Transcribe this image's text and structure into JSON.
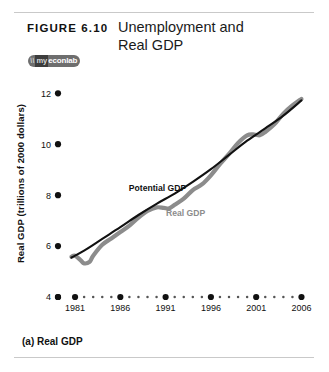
{
  "figure": {
    "number_label": "FIGURE  6.10",
    "title_line1": "Unemployment and",
    "title_line2": "Real GDP",
    "caption": "(a) Real GDP",
    "logo": {
      "mark": "\\\\",
      "my": "my",
      "econlab": "econlab"
    }
  },
  "chart_data": {
    "type": "line",
    "title": "Unemployment and Real GDP",
    "xlabel": "Year",
    "ylabel": "Real GDP (trillions of 2000 dollars)",
    "xlim": [
      1980,
      2006.5
    ],
    "ylim": [
      4,
      12.6
    ],
    "grid": false,
    "legend_position": "inline-annotation",
    "x_major_ticks": [
      "1981",
      "1986",
      "1991",
      "1996",
      "2001",
      "2006"
    ],
    "x_major_values": [
      1981,
      1986,
      1991,
      1996,
      2001,
      2006
    ],
    "x_minor_per_interval": 4,
    "y_ticks": [
      "4",
      "6",
      "8",
      "10",
      "12"
    ],
    "y_tick_values": [
      4,
      6,
      8,
      10,
      12
    ],
    "axis_style": "dotted-marker-axis",
    "series": [
      {
        "name": "Potential GDP",
        "color": "#111111",
        "label_x": 1990.1,
        "label_y": 8.15,
        "x": [
          1980.6,
          1982,
          1984,
          1986,
          1988,
          1990,
          1992,
          1994,
          1996,
          1998,
          2000,
          2002,
          2004,
          2006
        ],
        "values": [
          5.55,
          5.82,
          6.28,
          6.74,
          7.22,
          7.66,
          8.06,
          8.52,
          9.02,
          9.58,
          10.14,
          10.62,
          11.12,
          11.72
        ]
      },
      {
        "name": "Real GDP",
        "color": "#8c8c8c",
        "label_x": 1993.2,
        "label_y": 7.2,
        "x": [
          1980.6,
          1981,
          1981.6,
          1982,
          1982.6,
          1983,
          1984,
          1985,
          1986,
          1987,
          1988,
          1989,
          1990,
          1990.8,
          1991.4,
          1992,
          1993,
          1994,
          1995,
          1996,
          1997,
          1998,
          1999,
          2000,
          2000.8,
          2001.4,
          2002,
          2003,
          2004,
          2005,
          2006
        ],
        "values": [
          5.58,
          5.62,
          5.45,
          5.32,
          5.38,
          5.62,
          6.05,
          6.3,
          6.55,
          6.8,
          7.12,
          7.38,
          7.52,
          7.5,
          7.48,
          7.62,
          7.86,
          8.2,
          8.42,
          8.78,
          9.22,
          9.62,
          10.05,
          10.35,
          10.38,
          10.35,
          10.48,
          10.78,
          11.2,
          11.52,
          11.78
        ]
      }
    ],
    "annotations": [
      {
        "text": "Potential GDP",
        "color": "#111111"
      },
      {
        "text": "Real GDP",
        "color": "#8c8c8c"
      }
    ]
  }
}
